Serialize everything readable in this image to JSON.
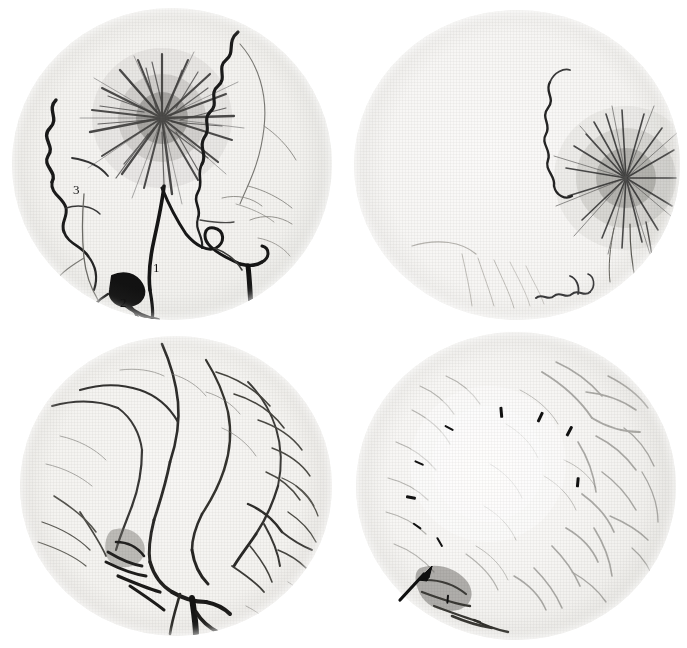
{
  "figure": {
    "background_color": "#ffffff",
    "panel_count": 4,
    "width": 687,
    "height": 648
  },
  "panels": [
    {
      "id": "panel-top-left",
      "position": "top-left",
      "caption": "",
      "view": "lateral external carotid angiogram, arterial phase",
      "annotations": {
        "numeric_labels": [
          {
            "text": "1",
            "x": 157,
            "y": 268
          },
          {
            "text": "2",
            "x": 124,
            "y": 303
          },
          {
            "text": "3",
            "x": 77,
            "y": 190
          }
        ],
        "arrows": [],
        "ticks": []
      }
    },
    {
      "id": "panel-top-right",
      "position": "top-right",
      "caption": "",
      "view": "frontal external carotid angiogram, tumour blush",
      "annotations": {
        "numeric_labels": [],
        "arrows": [],
        "ticks": []
      }
    },
    {
      "id": "panel-bottom-left",
      "position": "bottom-left",
      "caption": "",
      "view": "lateral internal carotid angiogram, capillary/venous phase",
      "annotations": {
        "numeric_labels": [],
        "arrows": [
          {
            "x": 118,
            "y": 543,
            "angle": 205,
            "length": 24
          }
        ],
        "ticks": []
      }
    },
    {
      "id": "panel-bottom-right",
      "position": "bottom-right",
      "caption": "",
      "view": "frontal internal carotid angiogram, capillary phase, avascular mass outlined",
      "annotations": {
        "numeric_labels": [],
        "arrows": [
          {
            "x": 402,
            "y": 570,
            "angle": 40,
            "length": 26
          }
        ],
        "ticks": [
          {
            "x": 446,
            "y": 429,
            "angle": 28,
            "length": 10
          },
          {
            "x": 498,
            "y": 413,
            "angle": 85,
            "length": 11
          },
          {
            "x": 537,
            "y": 418,
            "angle": 115,
            "length": 11
          },
          {
            "x": 566,
            "y": 432,
            "angle": 118,
            "length": 11
          },
          {
            "x": 416,
            "y": 464,
            "angle": 25,
            "length": 10
          },
          {
            "x": 575,
            "y": 483,
            "angle": 95,
            "length": 10
          },
          {
            "x": 408,
            "y": 498,
            "angle": 10,
            "length": 10
          },
          {
            "x": 414,
            "y": 527,
            "angle": 35,
            "length": 10
          },
          {
            "x": 436,
            "y": 543,
            "angle": 60,
            "length": 11
          },
          {
            "x": 445,
            "y": 600,
            "angle": 95,
            "length": 9
          }
        ]
      }
    }
  ],
  "colors": {
    "film_base": "#f4f3f1",
    "vessel_dark": "#1b1b1b",
    "vessel_mid": "#4d4c4a",
    "vessel_light": "#8c8a86",
    "annotation": "#111111",
    "page_background": "#ffffff"
  }
}
